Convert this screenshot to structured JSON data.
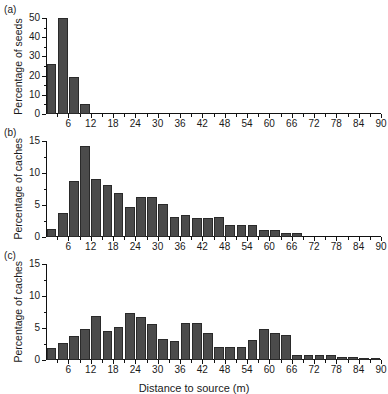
{
  "figure": {
    "xaxis_title": "Distance to source (m)",
    "bar_color": "#4b4b4b",
    "panels": [
      {
        "tag": "(a)",
        "ylabel": "Percentage of seeds"
      },
      {
        "tag": "(b)",
        "ylabel": "Percentage of caches"
      },
      {
        "tag": "(c)",
        "ylabel": "Percentage of caches"
      }
    ]
  },
  "chart_data": [
    {
      "type": "bar",
      "panel": "(a)",
      "title": "",
      "xlabel": "Distance to source (m)",
      "ylabel": "Percentage of seeds",
      "xlim": [
        0,
        90
      ],
      "ylim": [
        0,
        50
      ],
      "bin_width": 3,
      "grid": false,
      "legend": "none",
      "xticks": [
        6,
        12,
        18,
        24,
        30,
        36,
        42,
        48,
        54,
        60,
        66,
        72,
        78,
        84,
        90
      ],
      "xtick_labels": [
        "6",
        "12",
        "18",
        "24",
        "30",
        "36",
        "42",
        "48",
        "54",
        "60",
        "66",
        "72",
        "78",
        "84",
        "90"
      ],
      "yticks": [
        0,
        10,
        20,
        30,
        40,
        50
      ],
      "ytick_labels": [
        "0",
        "10",
        "20",
        "30",
        "40",
        "50"
      ],
      "bin_starts": [
        0,
        3,
        6,
        9,
        12,
        15,
        18,
        21,
        24,
        27,
        30,
        33,
        36,
        39,
        42,
        45,
        48,
        51,
        54,
        57,
        60,
        63,
        66,
        69,
        72,
        75,
        78,
        81,
        84,
        87
      ],
      "categories": [
        "0-3",
        "3-6",
        "6-9",
        "9-12",
        "12-15",
        "15-18",
        "18-21",
        "21-24",
        "24-27",
        "27-30",
        "30-33",
        "33-36",
        "36-39",
        "39-42",
        "42-45",
        "45-48",
        "48-51",
        "51-54",
        "54-57",
        "57-60",
        "60-63",
        "63-66",
        "66-69",
        "69-72",
        "72-75",
        "75-78",
        "78-81",
        "81-84",
        "84-87",
        "87-90"
      ],
      "values": [
        25.8,
        50.2,
        19.2,
        5.2,
        0,
        0,
        0,
        0,
        0,
        0,
        0,
        0,
        0,
        0,
        0,
        0,
        0,
        0,
        0,
        0,
        0,
        0,
        0,
        0,
        0,
        0,
        0,
        0,
        0,
        0
      ]
    },
    {
      "type": "bar",
      "panel": "(b)",
      "title": "",
      "xlabel": "Distance to source (m)",
      "ylabel": "Percentage of caches",
      "xlim": [
        0,
        90
      ],
      "ylim": [
        0,
        15
      ],
      "bin_width": 3,
      "grid": false,
      "legend": "none",
      "xticks": [
        6,
        12,
        18,
        24,
        30,
        36,
        42,
        48,
        54,
        60,
        66,
        72,
        78,
        84,
        90
      ],
      "xtick_labels": [
        "6",
        "12",
        "18",
        "24",
        "30",
        "36",
        "42",
        "48",
        "54",
        "60",
        "66",
        "72",
        "78",
        "84",
        "90"
      ],
      "yticks": [
        0,
        5,
        10,
        15
      ],
      "ytick_labels": [
        "0",
        "5",
        "10",
        "15"
      ],
      "bin_starts": [
        0,
        3,
        6,
        9,
        12,
        15,
        18,
        21,
        24,
        27,
        30,
        33,
        36,
        39,
        42,
        45,
        48,
        51,
        54,
        57,
        60,
        63,
        66,
        69,
        72,
        75,
        78,
        81,
        84,
        87
      ],
      "categories": [
        "0-3",
        "3-6",
        "6-9",
        "9-12",
        "12-15",
        "15-18",
        "18-21",
        "21-24",
        "24-27",
        "27-30",
        "30-33",
        "33-36",
        "36-39",
        "39-42",
        "42-45",
        "45-48",
        "48-51",
        "51-54",
        "54-57",
        "57-60",
        "60-63",
        "63-66",
        "66-69",
        "69-72",
        "72-75",
        "75-78",
        "78-81",
        "81-84",
        "84-87",
        "87-90"
      ],
      "values": [
        1.3,
        3.7,
        8.8,
        14.2,
        9.1,
        8.1,
        6.9,
        4.7,
        6.2,
        6.3,
        5.2,
        3.1,
        3.4,
        3.0,
        2.9,
        3.1,
        1.9,
        1.8,
        1.8,
        1.1,
        1.1,
        0.6,
        0.6,
        0,
        0,
        0,
        0,
        0,
        0,
        0
      ]
    },
    {
      "type": "bar",
      "panel": "(c)",
      "title": "",
      "xlabel": "Distance to source (m)",
      "ylabel": "Percentage of caches",
      "xlim": [
        0,
        90
      ],
      "ylim": [
        0,
        15
      ],
      "bin_width": 3,
      "grid": false,
      "legend": "none",
      "xticks": [
        6,
        12,
        18,
        24,
        30,
        36,
        42,
        48,
        54,
        60,
        66,
        72,
        78,
        84,
        90
      ],
      "xtick_labels": [
        "6",
        "12",
        "18",
        "24",
        "30",
        "36",
        "42",
        "48",
        "54",
        "60",
        "66",
        "72",
        "78",
        "84",
        "90"
      ],
      "yticks": [
        0,
        5,
        10,
        15
      ],
      "ytick_labels": [
        "0",
        "5",
        "10",
        "15"
      ],
      "bin_starts": [
        0,
        3,
        6,
        9,
        12,
        15,
        18,
        21,
        24,
        27,
        30,
        33,
        36,
        39,
        42,
        45,
        48,
        51,
        54,
        57,
        60,
        63,
        66,
        69,
        72,
        75,
        78,
        81,
        84,
        87
      ],
      "categories": [
        "0-3",
        "3-6",
        "6-9",
        "9-12",
        "12-15",
        "15-18",
        "18-21",
        "21-24",
        "24-27",
        "27-30",
        "30-33",
        "33-36",
        "36-39",
        "39-42",
        "42-45",
        "45-48",
        "48-51",
        "51-54",
        "54-57",
        "57-60",
        "60-63",
        "63-66",
        "66-69",
        "69-72",
        "72-75",
        "75-78",
        "78-81",
        "81-84",
        "84-87",
        "87-90"
      ],
      "values": [
        1.9,
        2.7,
        3.7,
        4.9,
        6.8,
        4.6,
        5.2,
        7.3,
        6.7,
        5.6,
        3.3,
        3.0,
        5.8,
        5.8,
        4.2,
        2.0,
        2.0,
        2.0,
        3.2,
        4.8,
        4.2,
        3.9,
        0.8,
        0.8,
        0.8,
        0.8,
        0.5,
        0.5,
        0.3,
        0.3
      ]
    }
  ]
}
